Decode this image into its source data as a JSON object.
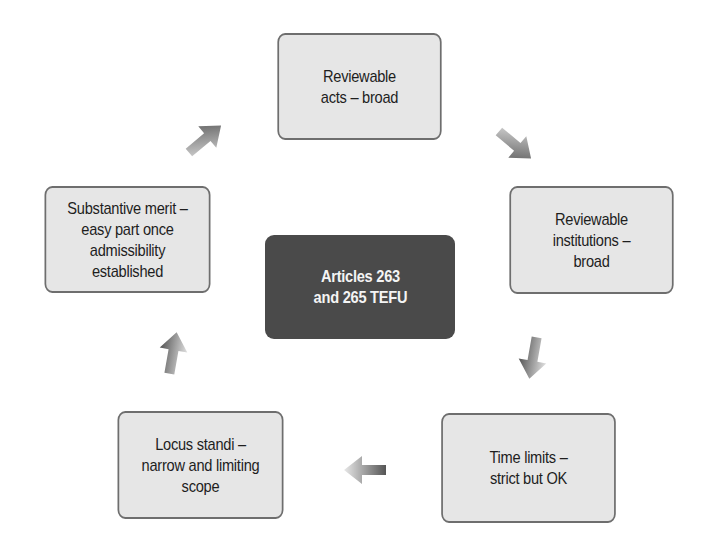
{
  "diagram": {
    "type": "cycle",
    "center": {
      "label": "Articles 263\nand 265 TEFU"
    },
    "nodes": [
      {
        "id": "reviewable-acts",
        "label": "Reviewable\nacts – broad"
      },
      {
        "id": "reviewable-institutions",
        "label": "Reviewable\ninstitutions –\nbroad"
      },
      {
        "id": "time-limits",
        "label": "Time limits –\nstrict but OK"
      },
      {
        "id": "locus-standi",
        "label": "Locus standi –\nnarrow and limiting\nscope"
      },
      {
        "id": "substantive-merit",
        "label": "Substantive merit –\neasy part once\nadmissibility\nestablished"
      }
    ],
    "arrows": [
      {
        "from": "reviewable-acts",
        "to": "reviewable-institutions",
        "icon": "arrow-down-right-icon"
      },
      {
        "from": "reviewable-institutions",
        "to": "time-limits",
        "icon": "arrow-down-icon"
      },
      {
        "from": "time-limits",
        "to": "locus-standi",
        "icon": "arrow-left-icon"
      },
      {
        "from": "locus-standi",
        "to": "substantive-merit",
        "icon": "arrow-up-icon"
      },
      {
        "from": "substantive-merit",
        "to": "reviewable-acts",
        "icon": "arrow-up-right-icon"
      }
    ],
    "colors": {
      "node_fill": "#e6e6e6",
      "node_border": "#6e6e6e",
      "center_fill": "#4a4a4a",
      "arrow": "#5a5a5a"
    }
  }
}
